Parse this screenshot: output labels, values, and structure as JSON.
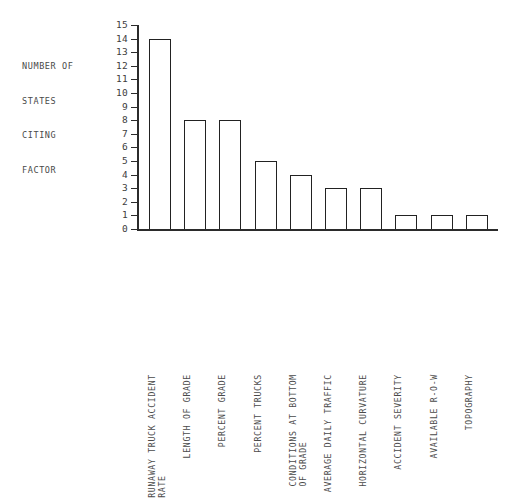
{
  "axis_caption": {
    "lines": [
      "NUMBER OF",
      "STATES",
      "CITING",
      "FACTOR"
    ]
  },
  "chart_data": {
    "type": "bar",
    "title": "",
    "xlabel": "",
    "ylabel": "NUMBER OF STATES CITING FACTOR",
    "ylim": [
      0,
      15
    ],
    "ytick_labels": [
      "0",
      "1",
      "2",
      "3",
      "4",
      "5",
      "6",
      "7",
      "8",
      "9",
      "10",
      "11",
      "12",
      "13",
      "14",
      "15"
    ],
    "grid": false,
    "legend": "none",
    "bar_style": {
      "fill": "#ffffff",
      "edge": "#222222"
    },
    "categories": [
      "RUNAWAY TRUCK ACCIDENT RATE",
      "LENGTH OF GRADE",
      "PERCENT GRADE",
      "PERCENT TRUCKS",
      "CONDITIONS AT BOTTOM OF GRADE",
      "AVERAGE DAILY TRAFFIC",
      "HORIZONTAL CURVATURE",
      "ACCIDENT SEVERITY",
      "AVAILABLE R-O-W",
      "TOPOGRAPHY"
    ],
    "category_lines": [
      [
        "RUNAWAY TRUCK ACCIDENT",
        "RATE"
      ],
      [
        "LENGTH OF GRADE"
      ],
      [
        "PERCENT GRADE"
      ],
      [
        "PERCENT TRUCKS"
      ],
      [
        "CONDITIONS AT BOTTOM",
        "OF GRADE"
      ],
      [
        "AVERAGE DAILY TRAFFIC"
      ],
      [
        "HORIZONTAL CURVATURE"
      ],
      [
        "ACCIDENT SEVERITY"
      ],
      [
        "AVAILABLE R-O-W"
      ],
      [
        "TOPOGRAPHY"
      ]
    ],
    "values": [
      14,
      8,
      8,
      5,
      4,
      3,
      3,
      1,
      1,
      1
    ]
  }
}
